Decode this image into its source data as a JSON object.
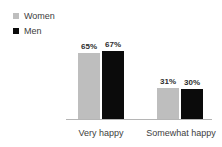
{
  "chart_data": {
    "type": "bar",
    "title": "",
    "subtitle": "",
    "xlabel": "",
    "ylabel": "",
    "categories": [
      "Very happy",
      "Somewhat happy"
    ],
    "series": [
      {
        "name": "Women",
        "color": "#bebebe",
        "values": [
          65,
          31
        ],
        "labels": [
          "65%",
          "31%"
        ]
      },
      {
        "name": "Men",
        "color": "#0b0b0b",
        "values": [
          67,
          30
        ],
        "labels": [
          "67%",
          "30%"
        ]
      }
    ],
    "ylim": [
      0,
      100
    ],
    "grid": false,
    "legend_position": "top-left",
    "value_labels": true,
    "axis_line_color": "#b5b5b5",
    "background": "#ffffff"
  },
  "legend": {
    "items": [
      {
        "label": "Women",
        "swatch_name": "legend-swatch-women",
        "color": "#bebebe"
      },
      {
        "label": "Men",
        "swatch_name": "legend-swatch-men",
        "color": "#0b0b0b"
      }
    ]
  },
  "axis": {
    "categories": [
      "Very happy",
      "Somewhat happy"
    ]
  }
}
